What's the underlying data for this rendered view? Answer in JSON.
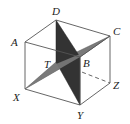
{
  "diagram": {
    "type": "cube-with-intersecting-planes",
    "vertices": {
      "A": {
        "label": "A",
        "x": 25,
        "y": 42
      },
      "D": {
        "label": "D",
        "x": 56,
        "y": 20
      },
      "C": {
        "label": "C",
        "x": 110,
        "y": 36
      },
      "B": {
        "label": "B",
        "x": 80,
        "y": 57
      },
      "X": {
        "label": "X",
        "x": 25,
        "y": 89
      },
      "T": {
        "label": "T",
        "x": 56,
        "y": 62
      },
      "Z": {
        "label": "Z",
        "x": 110,
        "y": 83
      },
      "Y": {
        "label": "Y",
        "x": 80,
        "y": 105
      }
    },
    "labels": {
      "A": "A",
      "D": "D",
      "C": "C",
      "B": "B",
      "X": "X",
      "T": "T",
      "Z": "Z",
      "Y": "Y"
    },
    "planes": [
      {
        "name": "DTYB",
        "vertices": [
          "D",
          "T",
          "Y",
          "B"
        ],
        "color": "#333333"
      },
      {
        "name": "XTCB",
        "vertices": [
          "X",
          "T",
          "C",
          "B"
        ],
        "color": "#7a7a7a"
      }
    ],
    "visible_edges": [
      [
        "A",
        "D"
      ],
      [
        "D",
        "C"
      ],
      [
        "C",
        "B"
      ],
      [
        "B",
        "A"
      ],
      [
        "A",
        "X"
      ],
      [
        "X",
        "Y"
      ],
      [
        "Y",
        "Z"
      ],
      [
        "Z",
        "C"
      ],
      [
        "B",
        "Y"
      ]
    ],
    "hidden_edges": [
      [
        "T",
        "Z"
      ]
    ]
  }
}
